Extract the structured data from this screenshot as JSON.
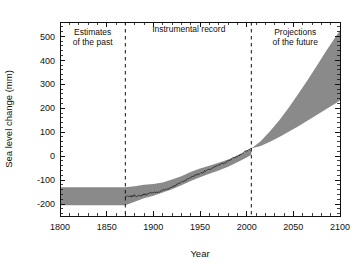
{
  "chart_data": {
    "type": "area",
    "title": "",
    "xlabel": "Year",
    "ylabel": "Sea level change (mm)",
    "xlim": [
      1800,
      2100
    ],
    "ylim": [
      -250,
      560
    ],
    "grid": false,
    "legend_position": "none",
    "xticks": [
      1800,
      1850,
      1900,
      1950,
      2000,
      2050,
      2100
    ],
    "xtick_labels": [
      "1800",
      "1850",
      "1900",
      "1950",
      "2000",
      "2050",
      "2100"
    ],
    "xminor_interval": 10,
    "yticks": [
      -200,
      -100,
      0,
      100,
      200,
      300,
      400,
      500
    ],
    "ytick_labels": [
      "-200",
      "-100",
      "0",
      "100",
      "200",
      "300",
      "400",
      "500"
    ],
    "yminor_interval": 20,
    "annotations": [
      {
        "name": "estimates-of-the-past",
        "lines": [
          "Estimates",
          "of the past"
        ],
        "x": 1835,
        "y": 505
      },
      {
        "name": "instrumental-record",
        "lines": [
          "Instrumental record"
        ],
        "x": 1938,
        "y": 520
      },
      {
        "name": "projections-of-the-future",
        "lines": [
          "Projections",
          "of the future"
        ],
        "x": 2052,
        "y": 505
      }
    ],
    "dividers": [
      {
        "name": "past-to-instrumental",
        "x": 1870
      },
      {
        "name": "instrumental-to-projection",
        "x": 2005
      }
    ],
    "series": [
      {
        "name": "Estimates of the past (uncertainty band)",
        "type": "band",
        "color": "#8a8a8a",
        "x": [
          1800,
          1820,
          1840,
          1860,
          1870,
          1880,
          1890,
          1900,
          1910,
          1920,
          1930,
          1940,
          1950,
          1960,
          1970,
          1980,
          1990,
          2000,
          2005
        ],
        "upper": [
          -130,
          -130,
          -130,
          -130,
          -130,
          -126,
          -120,
          -116,
          -110,
          -98,
          -84,
          -66,
          -52,
          -40,
          -28,
          -14,
          2,
          20,
          30
        ],
        "lower": [
          -205,
          -205,
          -205,
          -205,
          -205,
          -190,
          -176,
          -165,
          -152,
          -138,
          -122,
          -104,
          -88,
          -74,
          -60,
          -44,
          -26,
          -6,
          6
        ]
      },
      {
        "name": "Instrumental record",
        "type": "line",
        "color": "#2b2b2b",
        "x": [
          1870,
          1875,
          1880,
          1885,
          1890,
          1895,
          1900,
          1905,
          1910,
          1915,
          1920,
          1925,
          1930,
          1935,
          1940,
          1945,
          1950,
          1955,
          1960,
          1965,
          1970,
          1975,
          1980,
          1985,
          1990,
          1995,
          2000,
          2005
        ],
        "y": [
          -168,
          -170,
          -164,
          -167,
          -160,
          -158,
          -150,
          -152,
          -142,
          -138,
          -128,
          -120,
          -108,
          -100,
          -88,
          -80,
          -72,
          -64,
          -56,
          -48,
          -38,
          -30,
          -20,
          -10,
          0,
          10,
          22,
          32
        ]
      },
      {
        "name": "Projections of the future (uncertainty band)",
        "type": "band",
        "color": "#8a8a8a",
        "x": [
          2005,
          2015,
          2025,
          2035,
          2045,
          2055,
          2065,
          2075,
          2085,
          2095,
          2100
        ],
        "upper": [
          32,
          62,
          104,
          150,
          202,
          258,
          316,
          376,
          438,
          496,
          525
        ],
        "lower": [
          32,
          42,
          60,
          80,
          102,
          124,
          148,
          172,
          196,
          220,
          232
        ]
      }
    ]
  },
  "axes": {
    "x_title": "Year",
    "y_title": "Sea level change (mm)"
  }
}
